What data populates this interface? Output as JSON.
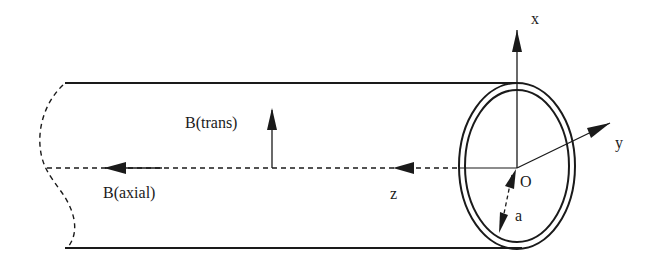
{
  "diagram": {
    "colors": {
      "stroke": "#1a1a1a",
      "background": "#ffffff"
    },
    "labels": {
      "x_axis": "x",
      "y_axis": "y",
      "z_axis": "z",
      "origin": "O",
      "radius": "a",
      "b_trans": "B(trans)",
      "b_axial": "B(axial)"
    },
    "elements": [
      {
        "id": "tube-top-edge",
        "type": "line"
      },
      {
        "id": "tube-bottom-edge",
        "type": "line"
      },
      {
        "id": "tube-broken-end",
        "type": "dashed-curve"
      },
      {
        "id": "tube-cross-section",
        "type": "double-ellipse"
      },
      {
        "id": "axis-x",
        "type": "arrow",
        "direction": "up"
      },
      {
        "id": "axis-y",
        "type": "arrow",
        "direction": "up-right"
      },
      {
        "id": "axis-z",
        "type": "arrow",
        "direction": "left",
        "style": "dashed"
      },
      {
        "id": "b-trans-vector",
        "type": "arrow",
        "direction": "up"
      },
      {
        "id": "b-axial-vector",
        "type": "arrow",
        "direction": "left"
      },
      {
        "id": "radius-a",
        "type": "double-arrow",
        "style": "dashed"
      }
    ]
  }
}
